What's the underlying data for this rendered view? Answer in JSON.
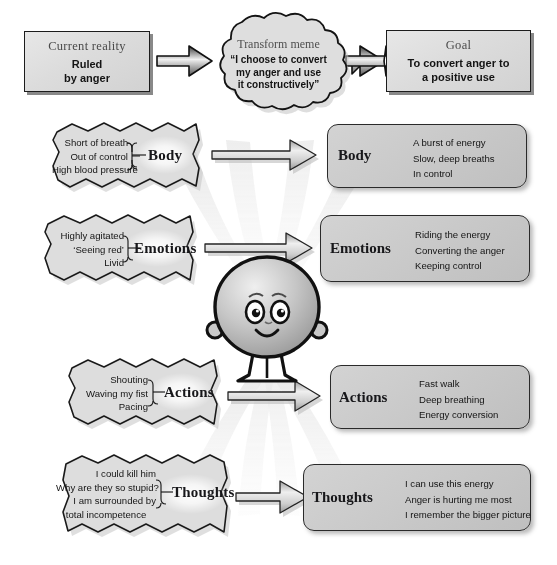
{
  "diagram": {
    "title_flow": [
      "Current reality",
      "Transform meme",
      "Goal"
    ],
    "top": {
      "current_reality": {
        "head": "Current reality",
        "lines": [
          "Ruled",
          "by anger"
        ]
      },
      "transform_meme": {
        "head": "Transform meme",
        "lines": [
          "“I choose to convert",
          "my anger and use",
          "it constructively”"
        ]
      },
      "goal": {
        "head": "Goal",
        "lines": [
          "To convert anger to",
          "a positive use"
        ]
      }
    },
    "rows": [
      {
        "id": "body",
        "category": "Body",
        "before": [
          "Short of breath",
          "Out of control",
          "High blood pressure"
        ],
        "after": [
          "A  burst of energy",
          "Slow, deep breaths",
          "In control"
        ]
      },
      {
        "id": "emotions",
        "category": "Emotions",
        "before": [
          "Highly agitated",
          "‘Seeing red’",
          "Livid"
        ],
        "after": [
          "Riding the energy",
          "Converting the anger",
          "Keeping control"
        ]
      },
      {
        "id": "actions",
        "category": "Actions",
        "before": [
          "Shouting",
          "Waving my fist",
          "Pacing"
        ],
        "after": [
          "Fast walk",
          "Deep breathing",
          "Energy conversion"
        ]
      },
      {
        "id": "thoughts",
        "category": "Thoughts",
        "before": [
          "I could kill him",
          "Why are they so stupid?",
          "I am surrounded by",
          "total incompetence"
        ],
        "after": [
          "I can use this energy",
          "Anger is hurting me most",
          "I remember the bigger picture"
        ]
      }
    ],
    "figure": {
      "name": "cartoon-person",
      "description": "round smiling character"
    },
    "colors": {
      "page_background": "#ffffff",
      "box_fill_light": "#dcdcdc",
      "box_fill_mid": "#c9c9c9",
      "outline": "#1c1c1c",
      "text": "#141414",
      "head_text": "#4a4a4a",
      "ray": "#dedede",
      "arrow_fill": "#d9d9d9"
    }
  }
}
